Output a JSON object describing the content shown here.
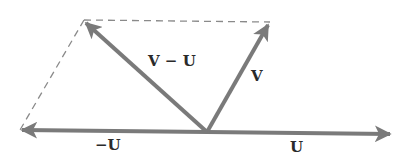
{
  "diagram": {
    "colors": {
      "vector": "#7a7a7a",
      "dashed": "#8a8a8a",
      "text": "#2a2a2a",
      "background": "#ffffff"
    },
    "origin": [
      207,
      132
    ],
    "vectors": [
      {
        "id": "U",
        "label": "U",
        "from": [
          207,
          132
        ],
        "to": [
          392,
          134
        ]
      },
      {
        "id": "neg_U",
        "label": "−U",
        "from": [
          207,
          132
        ],
        "to": [
          20,
          130
        ]
      },
      {
        "id": "V",
        "label": "V",
        "from": [
          207,
          132
        ],
        "to": [
          270,
          22
        ]
      },
      {
        "id": "V_minus_U",
        "label": "V − U",
        "from": [
          207,
          132
        ],
        "to": [
          84,
          20
        ]
      }
    ],
    "dashed_lines": [
      {
        "from": [
          84,
          20
        ],
        "to": [
          270,
          22
        ]
      },
      {
        "from": [
          84,
          20
        ],
        "to": [
          20,
          130
        ]
      }
    ],
    "labels": {
      "V_minus_U": "V − U",
      "V": "V",
      "neg_U": "−U",
      "U": "U"
    }
  }
}
